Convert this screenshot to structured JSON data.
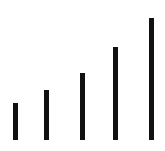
{
  "chart_data": {
    "type": "bar",
    "title": "",
    "xlabel": "",
    "ylabel": "",
    "categories": [
      "1",
      "2",
      "3",
      "4",
      "5"
    ],
    "values": [
      37,
      50,
      67,
      93,
      122
    ],
    "ylim": [
      0,
      125
    ],
    "grid": false,
    "legend": null,
    "bar_color": "#111111",
    "baseline_y": 140,
    "bar_x": [
      13,
      44,
      80,
      113,
      149
    ],
    "bar_width": 5
  }
}
